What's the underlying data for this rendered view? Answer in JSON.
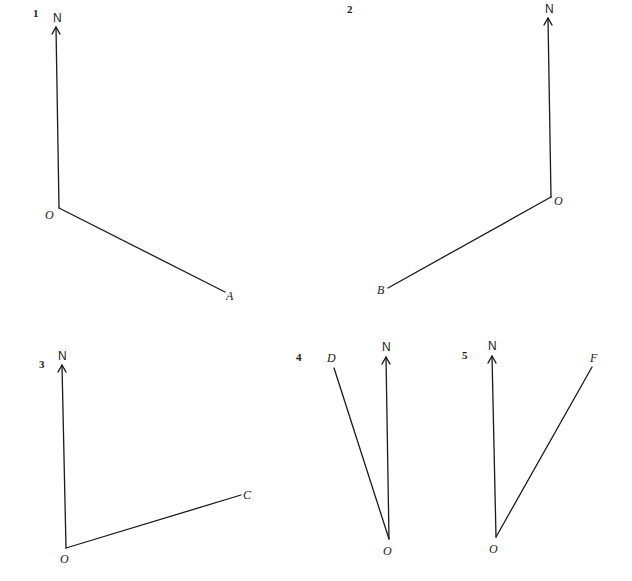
{
  "diagrams": [
    {
      "number": "1",
      "north_label": "N",
      "origin_label": "O",
      "point_label": "A",
      "direction": "south-east (bearing approx. 118°)"
    },
    {
      "number": "2",
      "north_label": "N",
      "origin_label": "O",
      "point_label": "B",
      "direction": "south-west (bearing approx. 240°)"
    },
    {
      "number": "3",
      "north_label": "N",
      "origin_label": "O",
      "point_label": "C",
      "direction": "east-north-east (bearing approx. 72°)"
    },
    {
      "number": "4",
      "north_label": "N",
      "origin_label": "O",
      "point_label": "D",
      "direction": "north-north-west (bearing approx. 344°)"
    },
    {
      "number": "5",
      "north_label": "N",
      "origin_label": "O",
      "point_label": "F",
      "direction": "north-north-east (bearing approx. 28°)"
    }
  ],
  "colors": {
    "ink": "#1a1a1a",
    "background": "#ffffff"
  }
}
